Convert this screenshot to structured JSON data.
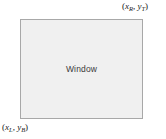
{
  "diagram": {
    "type": "window-clipping-rectangle",
    "background_color": "#ffffff",
    "window": {
      "label": "Window",
      "fill_color": "#f0f0f0",
      "border_color": "#a8a8a8"
    },
    "corner_labels": {
      "top_right": {
        "open_paren": "(",
        "x_var": "x",
        "x_sub": "R",
        "separator": ", ",
        "y_var": "y",
        "y_sub": "T",
        "close_paren": ")",
        "full_text": "(xR, yT)"
      },
      "bottom_left": {
        "open_paren": "(",
        "x_var": "x",
        "x_sub": "L",
        "separator": ", ",
        "y_var": "y",
        "y_sub": "B",
        "close_paren": ")",
        "full_text": "(xL, yB)"
      }
    }
  }
}
